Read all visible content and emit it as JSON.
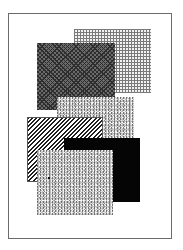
{
  "canvas": {
    "width": 183,
    "height": 250,
    "background": "#ffffff"
  },
  "frame": {
    "border_color": "#6b6b6b"
  },
  "panels": [
    {
      "name": "grid-pattern-panel",
      "pattern": "grid",
      "color": "#7a7a7a"
    },
    {
      "name": "dark-checker-panel",
      "pattern": "checker",
      "color": "#4a4a4a"
    },
    {
      "name": "mid-speckle-panel",
      "pattern": "speckle",
      "color": "#bdbdbd"
    },
    {
      "name": "diagonal-hatch-panel",
      "pattern": "diagonal-hatch",
      "color": "#1f1f1f"
    },
    {
      "name": "solid-black-panel",
      "pattern": "solid",
      "color": "#050505"
    },
    {
      "name": "front-speckle-panel",
      "pattern": "speckle",
      "color": "#bdbdbd"
    }
  ]
}
